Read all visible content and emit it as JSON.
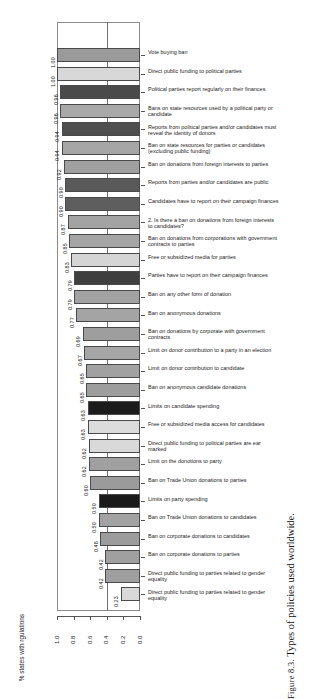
{
  "caption": {
    "prefix": "Figure 8.3.",
    "text": "Types of policies used worldwide."
  },
  "axis": {
    "ylabel": "% states with rgulations",
    "ticks": [
      "1.0",
      "0.8",
      "0.6",
      "0.4",
      "0.2",
      "0.0"
    ],
    "tick_values": [
      1.0,
      0.8,
      0.6,
      0.4,
      0.2,
      0.0
    ]
  },
  "chart_data": {
    "type": "bar",
    "orientation": "horizontal",
    "title": "",
    "xlabel": "",
    "ylabel": "% states with rgulations",
    "xlim": [
      1.0,
      0.0
    ],
    "reversed_axis": true,
    "grid": false,
    "gridline_at": 0.4,
    "legend": "none",
    "categories": [
      "Vote buying ban",
      "Direct public funding to political parties",
      "Political parties report regularly on their finances",
      "Bans on state resources used by a political party or candidate",
      "Reports from political parties and/or candidates must reveal the identity of donors",
      "Ban on state resources for parties or candidates (excluding public funding)",
      "Ban on donations from foreign interests to parties",
      "Reports from parties and/or candidates are public",
      "Candidates have to report on their campaign finances",
      "2. Is there a ban on donations from foreign interests to candidates?",
      "Ban on donations from corporations with government contracts to parties",
      "Free or subsidized media for parties",
      "Parties have to report on their campaign finances",
      "Ban on any other form of donation",
      "Ban on anonymous donations",
      "Ban on donations by corporate with government contracts",
      "Limit on donor contribution to a party in an election",
      "Limit on donor contribution to candidate",
      "Ban on anonymous candidate donations",
      "Limits on candidate spending",
      "Free or subsidized media access for candidates",
      "Direct public funding to political parties are ear marked",
      "Limit on the donotions to party",
      "Ban on Trade Union donations to parties",
      "Limits on party spending",
      "Ban on Trade Union donations to candidates",
      "Ban on corporate donations to candidates",
      "Ban on corporate donations to parties",
      "Direct public funding to parties related to gender equality"
    ],
    "values": [
      1.0,
      1.0,
      0.96,
      0.96,
      0.94,
      0.94,
      0.92,
      0.9,
      0.9,
      0.87,
      0.85,
      0.83,
      0.79,
      0.79,
      0.77,
      0.69,
      0.67,
      0.65,
      0.65,
      0.63,
      0.63,
      0.62,
      0.62,
      0.6,
      0.5,
      0.5,
      0.48,
      0.42,
      0.42
    ],
    "value_labels": [
      "1.00",
      "1.00",
      "0.96",
      "0.96",
      "0.94",
      "0.94",
      "0.92",
      "0.90",
      "0.90",
      "0.87",
      "0.85",
      "0.83",
      "0.79",
      "0.79",
      "0.77",
      "0.69",
      "0.67",
      "0.65",
      "0.65",
      "0.63",
      "0.63",
      "0.62",
      "0.62",
      "0.60",
      "0.50",
      "0.50",
      "0.48",
      "0.42",
      "0.42"
    ],
    "bar_colors": [
      "#9a9a9a",
      "#d8d8d8",
      "#4a4a4a",
      "#a8a8a8",
      "#4f4f4f",
      "#a6a6a6",
      "#a0a0a0",
      "#5a5a5a",
      "#5e5e5e",
      "#a3a3a3",
      "#a5a5a5",
      "#d5d5d5",
      "#3f3f3f",
      "#a2a2a2",
      "#a4a4a4",
      "#9e9e9e",
      "#a6a6a6",
      "#a1a1a1",
      "#9d9d9d",
      "#1c1c1c",
      "#dcdcdc",
      "#d9d9d9",
      "#a0a0a0",
      "#9b9b9b",
      "#1a1a1a",
      "#a2a2a2",
      "#9c9c9c",
      "#a0a0a0",
      "#9f9f9f"
    ],
    "extra_row": {
      "label": "Direct public funding to parties related to gender equality",
      "value": 0.23,
      "value_label": "0.23",
      "color": "#d9d9d9"
    }
  }
}
